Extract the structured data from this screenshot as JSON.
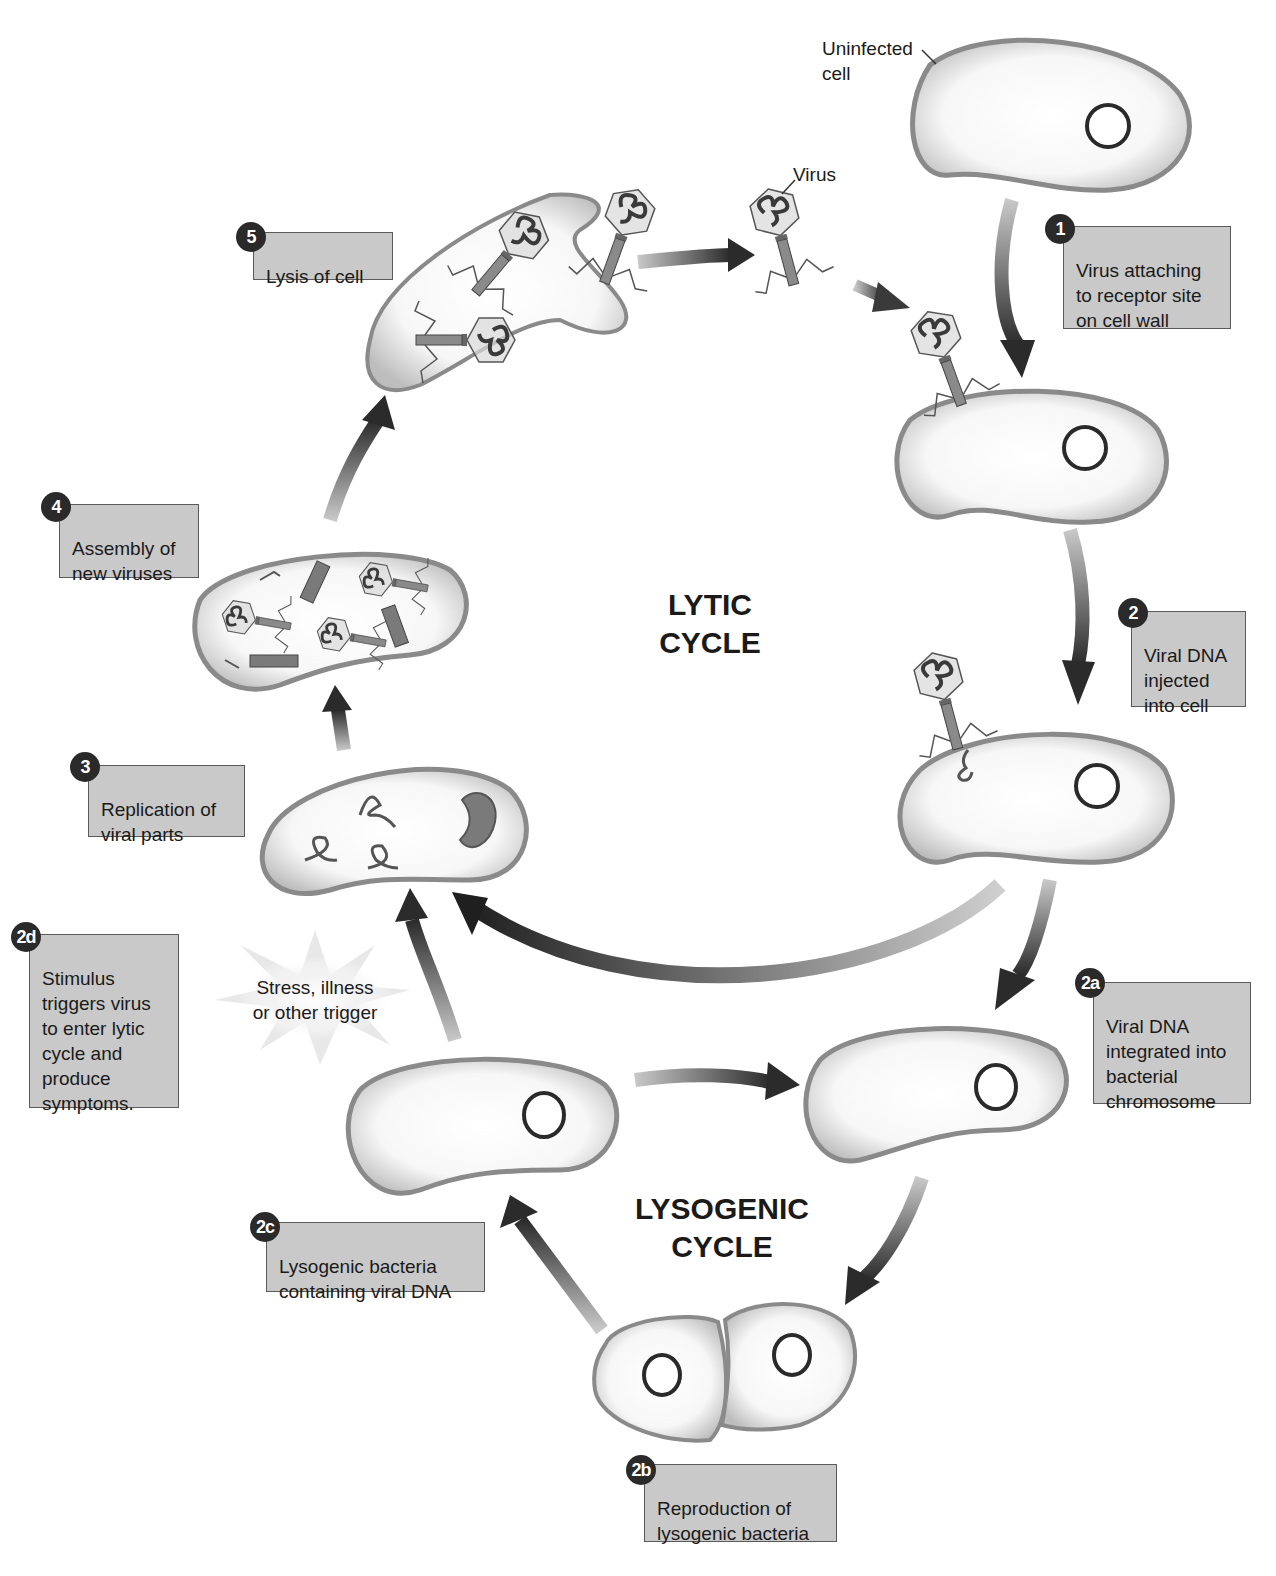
{
  "diagram": {
    "titles": {
      "lytic": "LYTIC\nCYCLE",
      "lysogenic": "LYSOGENIC\nCYCLE"
    },
    "annotations": {
      "uninfected_cell": "Uninfected\ncell",
      "virus": "Virus",
      "trigger": "Stress, illness\nor other trigger"
    },
    "steps": [
      {
        "id": "1",
        "badge": "1",
        "text": "Virus attaching\nto receptor site\non cell wall"
      },
      {
        "id": "2",
        "badge": "2",
        "text": "Viral DNA\ninjected\ninto cell"
      },
      {
        "id": "3",
        "badge": "3",
        "text": "Replication of\nviral parts"
      },
      {
        "id": "4",
        "badge": "4",
        "text": "Assembly of\nnew viruses"
      },
      {
        "id": "5",
        "badge": "5",
        "text": "Lysis of cell"
      },
      {
        "id": "2a",
        "badge": "2a",
        "text": "Viral DNA\nintegrated into\nbacterial\nchromosome"
      },
      {
        "id": "2b",
        "badge": "2b",
        "text": "Reproduction of\nlysogenic bacteria"
      },
      {
        "id": "2c",
        "badge": "2c",
        "text": "Lysogenic bacteria\ncontaining viral DNA"
      },
      {
        "id": "2d",
        "badge": "2d",
        "text": "Stimulus\ntriggers virus\nto enter lytic\ncycle and\nproduce\nsymptoms."
      }
    ],
    "colors": {
      "box_fill": "#c9c9c9",
      "box_border": "#5a5a5a",
      "badge": "#2a2a2a",
      "arrow_dark": "#2b2b2b",
      "arrow_light": "#bdbdbd",
      "cell_wall": "#8a8a8a"
    }
  }
}
